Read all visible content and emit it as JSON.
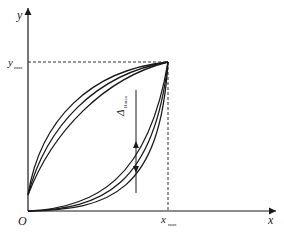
{
  "diagram": {
    "type": "hysteresis-loop",
    "axes": {
      "x_label": "x",
      "y_label": "y",
      "origin_label": "O",
      "x_tick_label": {
        "main": "x",
        "sub": "max"
      },
      "y_tick_label": {
        "main": "y",
        "sub": "max"
      }
    },
    "annotation": {
      "main": "Δ",
      "sub": "Hmax"
    },
    "loops": 3,
    "colors": {
      "line": "#1a1a1a",
      "background": "#ffffff"
    }
  }
}
